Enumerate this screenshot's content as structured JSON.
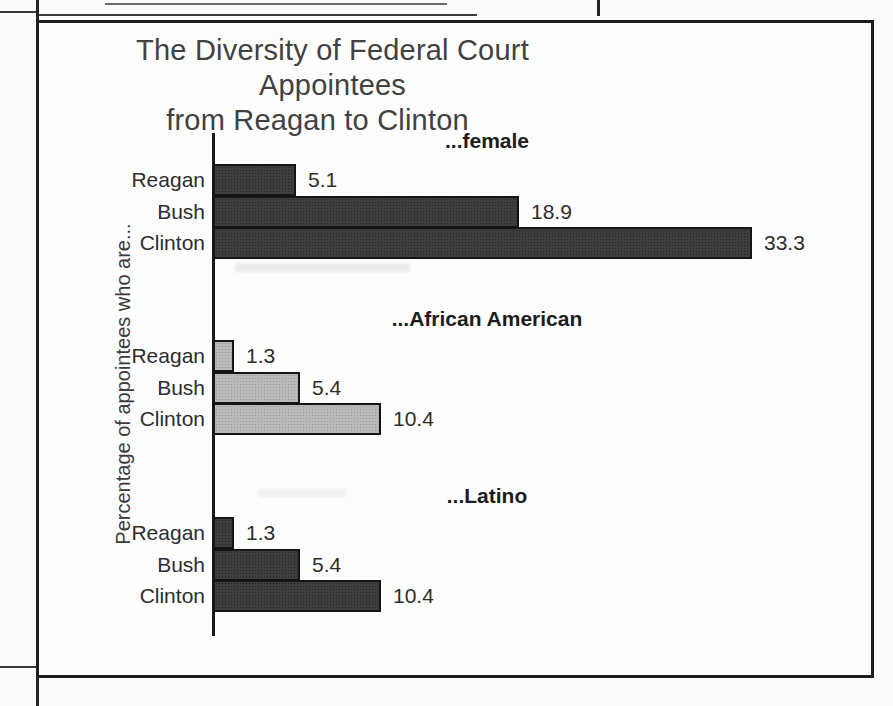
{
  "chart_data": {
    "type": "bar",
    "orientation": "horizontal",
    "title": "The Diversity of Federal Court Appointees from Reagan to Clinton",
    "title_lines": [
      "The Diversity of Federal Court Appointees",
      "from Reagan to Clinton"
    ],
    "ylabel": "Percentage of appointees who are...",
    "categories": [
      "Reagan",
      "Bush",
      "Clinton"
    ],
    "groups": [
      {
        "heading": "...female",
        "bar_style": "dark",
        "values": [
          5.1,
          18.9,
          33.3
        ]
      },
      {
        "heading": "...African American",
        "bar_style": "light",
        "values": [
          1.3,
          5.4,
          10.4
        ]
      },
      {
        "heading": "...Latino",
        "bar_style": "dark",
        "values": [
          1.3,
          5.4,
          10.4
        ]
      }
    ],
    "data_labels": true,
    "grid": false,
    "legend": false,
    "xlim": [
      0,
      40
    ],
    "colors": {
      "dark_bar": "#3e3e3e",
      "light_bar": "#b9b9b9",
      "axis": "#1a1a1a",
      "text": "#2d2d2d"
    }
  }
}
